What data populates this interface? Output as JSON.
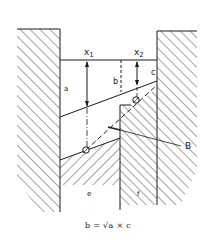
{
  "diagram": {
    "labels": {
      "x1": "x",
      "x1_sub": "1",
      "x2": "x",
      "x2_sub": "2",
      "a": "a",
      "b": "b",
      "c": "c",
      "e": "e",
      "f": "f",
      "B": "B"
    },
    "formula": "b = √a × c",
    "colors": {
      "ink": "#1a1a1a",
      "background": "#ffffff"
    }
  }
}
